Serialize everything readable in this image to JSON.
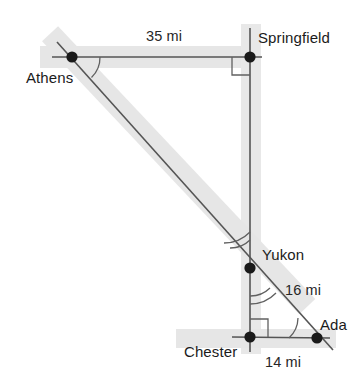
{
  "figure": {
    "width": 358,
    "height": 380,
    "background_color": "#ffffff",
    "stroke_color": "#4a4a4a",
    "band_color": "#e3e3e3",
    "vertex_color": "#1a1a1a",
    "arc_color": "#555555"
  },
  "points": [
    {
      "id": "athens",
      "label": "Athens",
      "x": 72,
      "y": 57,
      "dot": true
    },
    {
      "id": "springfield",
      "label": "Springfield",
      "x": 250,
      "y": 57,
      "dot": true
    },
    {
      "id": "yukon",
      "label": "Yukon",
      "x": 250,
      "y": 268,
      "dot": true
    },
    {
      "id": "chester",
      "label": "Chester",
      "x": 250,
      "y": 337,
      "dot": true
    },
    {
      "id": "ada",
      "label": "Ada",
      "x": 317,
      "y": 338,
      "dot": true
    }
  ],
  "measures": [
    {
      "id": "len-35",
      "value": "35 mi",
      "between": "Athens-Springfield"
    },
    {
      "id": "len-16",
      "value": "16 mi",
      "between": "Yukon-Ada"
    },
    {
      "id": "len-14",
      "value": "14 mi",
      "between": "Chester-Ada"
    }
  ],
  "angle_marks": [
    {
      "id": "angle-athens",
      "at": "athens",
      "type": "arc",
      "arcs": 1
    },
    {
      "id": "angle-springfield",
      "at": "springfield",
      "type": "right-angle"
    },
    {
      "id": "angle-yukon-upper",
      "at": "yukon",
      "type": "arc",
      "arcs": 1
    },
    {
      "id": "angle-yukon-lower",
      "at": "yukon",
      "type": "arc",
      "arcs": 1
    },
    {
      "id": "angle-chester",
      "at": "chester",
      "type": "right-angle"
    },
    {
      "id": "angle-ada",
      "at": "ada",
      "type": "arc",
      "arcs": 1
    }
  ],
  "segments": [
    {
      "id": "seg-athens-springfield",
      "from": "athens",
      "to": "springfield"
    },
    {
      "id": "seg-springfield-chester",
      "from": "springfield",
      "to": "chester"
    },
    {
      "id": "seg-chester-ada",
      "from": "chester",
      "to": "ada"
    },
    {
      "id": "seg-athens-ada",
      "from": "athens",
      "to": "ada"
    }
  ]
}
